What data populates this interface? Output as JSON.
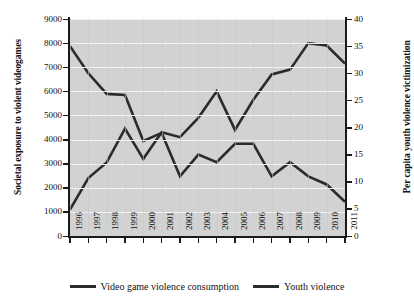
{
  "chart_data": {
    "type": "line",
    "title": "",
    "xlabel": "",
    "categories": [
      "1996",
      "1997",
      "1998",
      "1999",
      "2000",
      "2001",
      "2002",
      "2003",
      "2004",
      "2005",
      "2006",
      "2007",
      "2008",
      "2009",
      "2010",
      "2011"
    ],
    "grid": true,
    "legend_position": "bottom",
    "axes": {
      "left": {
        "label": "Societal exposure to violent videogames",
        "ylim": [
          0,
          9000
        ],
        "ticks": [
          0,
          1000,
          2000,
          3000,
          4000,
          5000,
          6000,
          7000,
          8000,
          9000
        ],
        "tick_labels": [
          "0",
          "1000",
          "2000",
          "3000",
          "4000",
          "5000",
          "6000",
          "7000",
          "8000",
          "9000"
        ]
      },
      "right": {
        "label": "Per capita youth violence victimization",
        "ylim": [
          0,
          40
        ],
        "ticks": [
          0,
          5,
          10,
          15,
          20,
          25,
          30,
          35,
          40
        ],
        "tick_labels": [
          "0",
          "5",
          "10",
          "15",
          "20",
          "25",
          "30",
          "35",
          "40"
        ]
      }
    },
    "series": [
      {
        "name": "Video game violence consumption",
        "axis": "left",
        "color": "#2b2b2b",
        "values": [
          1100,
          2400,
          3050,
          4450,
          3200,
          4300,
          4100,
          4900,
          6000,
          4400,
          5650,
          6700,
          6900,
          8000,
          7900,
          7150
        ]
      },
      {
        "name": "Youth violence",
        "axis": "right",
        "color": "#2b2b2b",
        "values": [
          35.0,
          30.0,
          26.2,
          26.0,
          17.5,
          19.0,
          11.0,
          15.0,
          13.6,
          17.0,
          17.0,
          11.0,
          13.6,
          11.0,
          9.5,
          6.3
        ]
      }
    ]
  },
  "legend": {
    "items": [
      {
        "label": "Video game violence consumption"
      },
      {
        "label": "Youth violence"
      }
    ]
  }
}
